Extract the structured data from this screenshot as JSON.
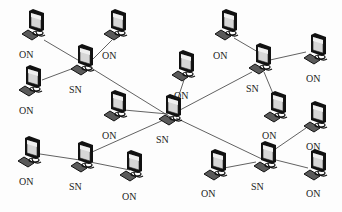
{
  "diagram": {
    "type": "network-topology",
    "colors": {
      "line": "#3a3a3a",
      "outline": "#111111",
      "screen": "#d8d8d8",
      "screen_shade": "#9a9a9a",
      "keyboard": "#555555",
      "text": "#222222"
    },
    "nodes": [
      {
        "id": "SN1",
        "type": "SN",
        "label": "SN",
        "x": 85,
        "y": 57,
        "lx": 69,
        "ly": 93
      },
      {
        "id": "SN2",
        "type": "SN",
        "label": "SN",
        "x": 173,
        "y": 107,
        "lx": 156,
        "ly": 143
      },
      {
        "id": "SN3",
        "type": "SN",
        "label": "SN",
        "x": 263,
        "y": 56,
        "lx": 246,
        "ly": 92
      },
      {
        "id": "SN4",
        "type": "SN",
        "label": "SN",
        "x": 268,
        "y": 154,
        "lx": 251,
        "ly": 190
      },
      {
        "id": "SN5",
        "type": "SN",
        "label": "SN",
        "x": 85,
        "y": 154,
        "lx": 69,
        "ly": 190
      },
      {
        "id": "ON1",
        "type": "ON",
        "label": "ON",
        "x": 36,
        "y": 22,
        "lx": 19,
        "ly": 58
      },
      {
        "id": "ON2",
        "type": "ON",
        "label": "ON",
        "x": 118,
        "y": 22,
        "lx": 102,
        "ly": 59
      },
      {
        "id": "ON3",
        "type": "ON",
        "label": "ON",
        "x": 33,
        "y": 78,
        "lx": 19,
        "ly": 114
      },
      {
        "id": "ON4",
        "type": "ON",
        "label": "ON",
        "x": 118,
        "y": 103,
        "lx": 102,
        "ly": 139
      },
      {
        "id": "ON5",
        "type": "ON",
        "label": "ON",
        "x": 186,
        "y": 63,
        "lx": 174,
        "ly": 99
      },
      {
        "id": "ON6",
        "type": "ON",
        "label": "ON",
        "x": 229,
        "y": 22,
        "lx": 213,
        "ly": 59
      },
      {
        "id": "ON7",
        "type": "ON",
        "label": "ON",
        "x": 318,
        "y": 46,
        "lx": 306,
        "ly": 82
      },
      {
        "id": "ON8",
        "type": "ON",
        "label": "ON",
        "x": 278,
        "y": 104,
        "lx": 262,
        "ly": 139
      },
      {
        "id": "ON9",
        "type": "ON",
        "label": "ON",
        "x": 318,
        "y": 114,
        "lx": 306,
        "ly": 150
      },
      {
        "id": "ON10",
        "type": "ON",
        "label": "ON",
        "x": 318,
        "y": 162,
        "lx": 306,
        "ly": 197
      },
      {
        "id": "ON11",
        "type": "ON",
        "label": "ON",
        "x": 218,
        "y": 162,
        "lx": 201,
        "ly": 197
      },
      {
        "id": "ON12",
        "type": "ON",
        "label": "ON",
        "x": 32,
        "y": 149,
        "lx": 19,
        "ly": 185
      },
      {
        "id": "ON13",
        "type": "ON",
        "label": "ON",
        "x": 134,
        "y": 163,
        "lx": 122,
        "ly": 200
      }
    ],
    "edges": [
      {
        "from": "ON1",
        "to": "SN1",
        "x1": 44,
        "y1": 40,
        "x2": 88,
        "y2": 66
      },
      {
        "from": "SN1",
        "to": "ON2",
        "x1": 90,
        "y1": 62,
        "x2": 112,
        "y2": 40
      },
      {
        "from": "ON3",
        "to": "SN1",
        "x1": 42,
        "y1": 80,
        "x2": 74,
        "y2": 68
      },
      {
        "from": "SN1",
        "to": "SN2",
        "x1": 88,
        "y1": 66,
        "x2": 172,
        "y2": 118
      },
      {
        "from": "ON4",
        "to": "SN2",
        "x1": 124,
        "y1": 110,
        "x2": 168,
        "y2": 114
      },
      {
        "from": "ON5",
        "to": "SN2",
        "x1": 184,
        "y1": 80,
        "x2": 178,
        "y2": 98
      },
      {
        "from": "SN2",
        "to": "SN3",
        "x1": 180,
        "y1": 110,
        "x2": 252,
        "y2": 72
      },
      {
        "from": "ON6",
        "to": "SN3",
        "x1": 234,
        "y1": 38,
        "x2": 258,
        "y2": 52
      },
      {
        "from": "SN3",
        "to": "ON7",
        "x1": 270,
        "y1": 60,
        "x2": 306,
        "y2": 52
      },
      {
        "from": "SN3",
        "to": "ON8",
        "x1": 264,
        "y1": 72,
        "x2": 274,
        "y2": 96
      },
      {
        "from": "SN2",
        "to": "SN4",
        "x1": 176,
        "y1": 118,
        "x2": 264,
        "y2": 160
      },
      {
        "from": "SN4",
        "to": "ON9",
        "x1": 274,
        "y1": 150,
        "x2": 306,
        "y2": 128
      },
      {
        "from": "SN4",
        "to": "ON10",
        "x1": 276,
        "y1": 160,
        "x2": 308,
        "y2": 168
      },
      {
        "from": "ON11",
        "to": "SN4",
        "x1": 224,
        "y1": 168,
        "x2": 256,
        "y2": 162
      },
      {
        "from": "SN2",
        "to": "SN5",
        "x1": 168,
        "y1": 118,
        "x2": 92,
        "y2": 152
      },
      {
        "from": "ON12",
        "to": "SN5",
        "x1": 40,
        "y1": 154,
        "x2": 80,
        "y2": 160
      },
      {
        "from": "SN5",
        "to": "ON13",
        "x1": 90,
        "y1": 162,
        "x2": 130,
        "y2": 170
      }
    ],
    "legend": {
      "SN": "SN",
      "ON": "ON"
    }
  }
}
